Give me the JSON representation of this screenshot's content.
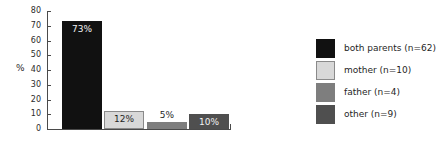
{
  "chart_data": {
    "type": "bar",
    "title": "",
    "xlabel": "",
    "ylabel": "%",
    "ylim": [
      0,
      80
    ],
    "ytick_step": 10,
    "yticks": [
      80,
      70,
      60,
      50,
      40,
      30,
      20,
      10,
      0
    ],
    "grid": false,
    "legend_position": "right",
    "categories": [
      "both parents",
      "mother",
      "father",
      "other"
    ],
    "values": [
      73,
      12,
      5,
      10
    ],
    "data_labels": [
      "73%",
      "12%",
      "5%",
      "10%"
    ],
    "counts": [
      62,
      10,
      4,
      9
    ],
    "legend_entries": [
      {
        "label": "both parents (n=62)",
        "color": "#111111"
      },
      {
        "label": "mother (n=10)",
        "color": "#d8d8d8"
      },
      {
        "label": "father (n=4)",
        "color": "#7e7e7e"
      },
      {
        "label": "other (n=9)",
        "color": "#4f4f4f"
      }
    ],
    "bars": [
      {
        "category": "both parents",
        "value": 73,
        "label": "73%",
        "color": "#111111",
        "label_color": "#f2f2f2",
        "label_position": "inside-top"
      },
      {
        "category": "mother",
        "value": 12,
        "label": "12%",
        "color": "#d8d8d8",
        "label_color": "#1f1f1f",
        "label_position": "inside-top"
      },
      {
        "category": "father",
        "value": 5,
        "label": "5%",
        "color": "#7e7e7e",
        "label_color": "#1f1f1f",
        "label_position": "outside-top"
      },
      {
        "category": "other",
        "value": 10,
        "label": "10%",
        "color": "#4f4f4f",
        "label_color": "#f2f2f2",
        "label_position": "inside-top"
      }
    ],
    "axis_color": "#4a4a4a"
  },
  "axis": {
    "y_title": "%",
    "tick_labels": [
      "80",
      "70",
      "60",
      "50",
      "40",
      "30",
      "20",
      "10",
      "0"
    ]
  },
  "legend": {
    "items": [
      {
        "label": "both parents (n=62)"
      },
      {
        "label": "mother (n=10)"
      },
      {
        "label": "father (n=4)"
      },
      {
        "label": "other (n=9)"
      }
    ]
  },
  "bar_labels": {
    "b0": "73%",
    "b1": "12%",
    "b2": "5%",
    "b3": "10%"
  }
}
